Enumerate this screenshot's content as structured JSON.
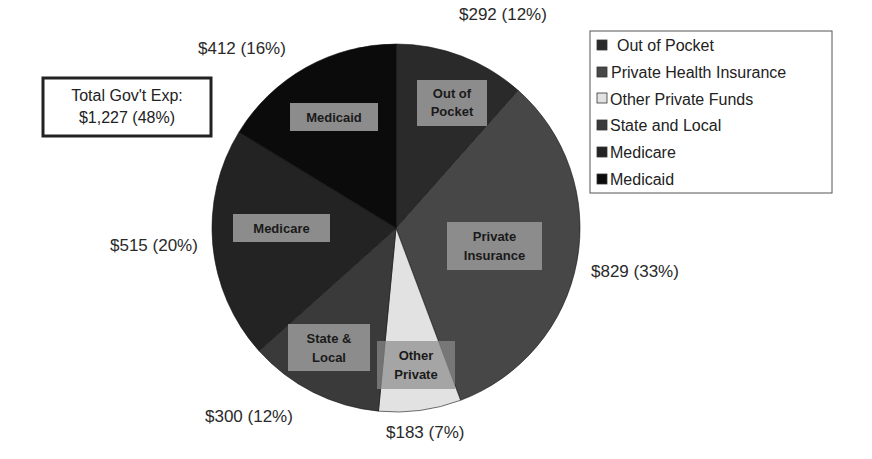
{
  "chart_data": {
    "type": "pie",
    "title": "",
    "start_angle_deg": 0,
    "direction": "clockwise",
    "categories": [
      "Out of Pocket",
      "Private Health Insurance",
      "Other Private Funds",
      "State and Local",
      "Medicare",
      "Medicaid"
    ],
    "values": [
      292,
      829,
      183,
      300,
      515,
      412
    ],
    "percents": [
      12,
      33,
      7,
      12,
      20,
      16
    ],
    "slices": [
      {
        "legend": "Out of Pocket",
        "short_label": [
          "Out of",
          "Pocket"
        ],
        "value": 292,
        "percent": 12,
        "value_label": "$292 (12%)",
        "color": "#2a2a2a"
      },
      {
        "legend": "Private Health Insurance",
        "short_label": [
          "Private",
          "Insurance"
        ],
        "value": 829,
        "percent": 33,
        "value_label": "$829 (33%)",
        "color": "#474747"
      },
      {
        "legend": "Other Private Funds",
        "short_label": [
          "Other",
          "Private"
        ],
        "value": 183,
        "percent": 7,
        "value_label": "$183 (7%)",
        "color": "#e2e2e2"
      },
      {
        "legend": "State and Local",
        "short_label": [
          "State &",
          "Local"
        ],
        "value": 300,
        "percent": 12,
        "value_label": "$300 (12%)",
        "color": "#3a3a3a"
      },
      {
        "legend": "Medicare",
        "short_label": [
          "Medicare"
        ],
        "value": 515,
        "percent": 20,
        "value_label": "$515 (20%)",
        "color": "#232323"
      },
      {
        "legend": "Medicaid",
        "short_label": [
          "Medicaid"
        ],
        "value": 412,
        "percent": 16,
        "value_label": "$412 (16%)",
        "color": "#0b0b0b"
      }
    ],
    "annotation": {
      "line1": "Total Gov't Exp:",
      "line2": "$1,227 (48%)"
    },
    "legend_position": "right",
    "label_box_color": "#8c8c8c"
  }
}
